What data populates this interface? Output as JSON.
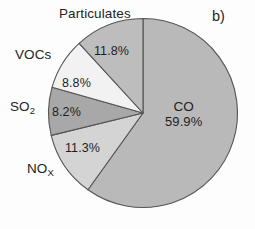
{
  "panel": {
    "label": "b)"
  },
  "chart_data": {
    "type": "pie",
    "title": "",
    "categories": [
      "CO",
      "NOx",
      "SO2",
      "VOCs",
      "Particulates"
    ],
    "values": [
      59.9,
      11.3,
      8.2,
      8.8,
      11.8
    ],
    "value_labels": [
      "59.9%",
      "11.3%",
      "8.2%",
      "8.8%",
      "11.8%"
    ],
    "units": "percent",
    "start_angle_deg": 0,
    "direction": "clockwise",
    "legend": "none",
    "grid": false,
    "slices": [
      {
        "name": "CO",
        "label": "CO",
        "value": 59.9,
        "value_label": "59.9%",
        "color": "#b9b9b9",
        "label_placement": "inside"
      },
      {
        "name": "NOx",
        "label": "NO",
        "sublabel": "X",
        "value": 11.3,
        "value_label": "11.3%",
        "color": "#d4d4d4",
        "label_placement": "outside-left"
      },
      {
        "name": "SO2",
        "label": "SO",
        "sublabel": "2",
        "value": 8.2,
        "value_label": "8.2%",
        "color": "#a8a8a8",
        "label_placement": "outside-left"
      },
      {
        "name": "VOCs",
        "label": "VOCs",
        "value": 8.8,
        "value_label": "8.8%",
        "color": "#f2f2f2",
        "label_placement": "outside-left"
      },
      {
        "name": "Particulates",
        "label": "Particulates",
        "value": 11.8,
        "value_label": "11.8%",
        "color": "#bdbdbd",
        "label_placement": "outside-top"
      }
    ],
    "colors": {
      "outline": "#555555",
      "background": "#fdfdfd",
      "text": "#1d1d1d"
    }
  },
  "labels": {
    "particulates": "Particulates",
    "vocs": "VOCs",
    "so2_base": "SO",
    "so2_sub": "2",
    "nox_base": "NO",
    "nox_sub": "X",
    "co_name": "CO"
  },
  "values": {
    "particulates": "11.8%",
    "vocs": "8.8%",
    "so2": "8.2%",
    "nox": "11.3%",
    "co": "59.9%"
  }
}
